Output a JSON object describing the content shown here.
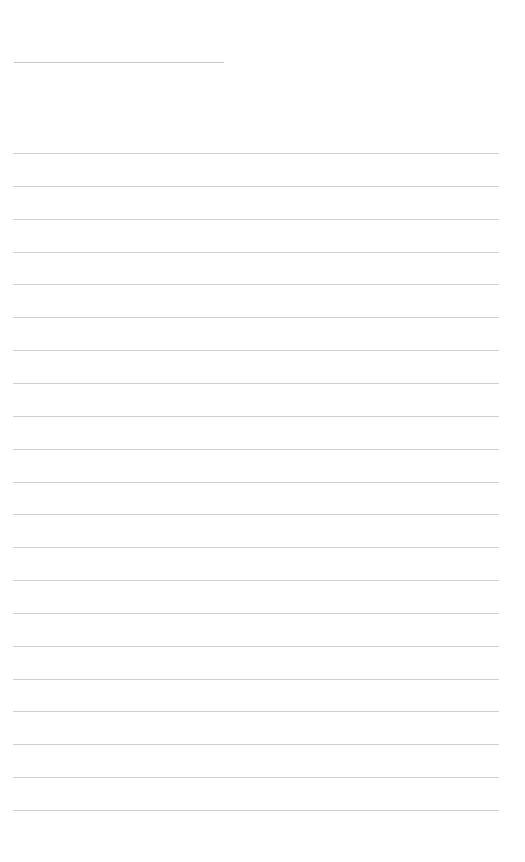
{
  "page": {
    "type": "lined-sheet",
    "background": "#ffffff",
    "line_color": "#cfcfcf",
    "title_line": {
      "y": 62,
      "x": 14,
      "width": 210
    },
    "rules": {
      "count": 21,
      "first_y": 153,
      "spacing": 32.85,
      "x": 13,
      "width": 486
    }
  }
}
